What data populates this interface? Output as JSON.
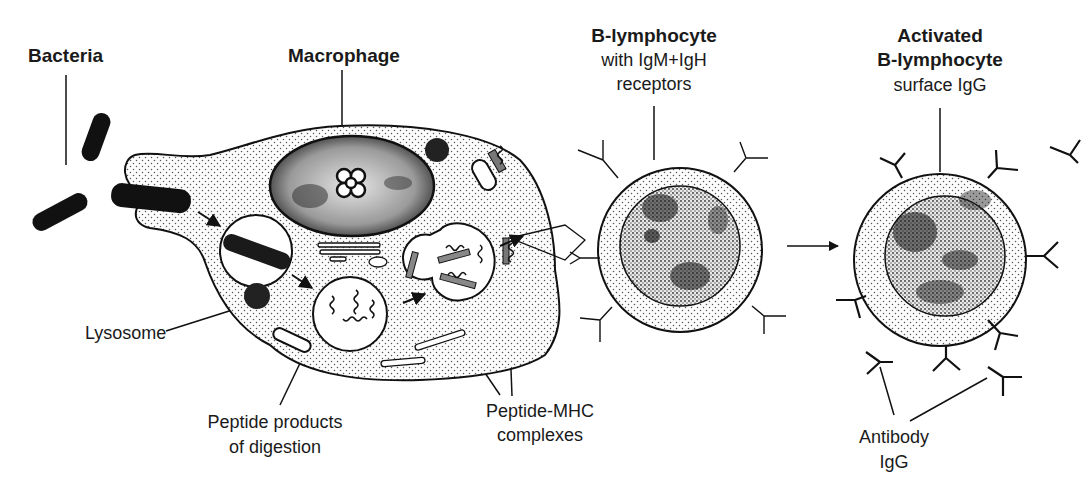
{
  "diagram": {
    "colors": {
      "ink": "#111111",
      "background": "#ffffff",
      "stipple": "#555555"
    },
    "labels": {
      "bacteria": "Bacteria",
      "macrophage": "Macrophage",
      "b_lymphocyte": {
        "title": "B-lymphocyte",
        "line1": "with IgM+IgH",
        "line2": "receptors"
      },
      "activated_b_lymphocyte": {
        "title1": "Activated",
        "title2": "B-lymphocyte",
        "line1": "surface IgG"
      },
      "lysosome": "Lysosome",
      "peptide_products": {
        "line1": "Peptide products",
        "line2": "of digestion"
      },
      "peptide_mhc": {
        "line1": "Peptide-MHC",
        "line2": "complexes"
      },
      "antibody": {
        "line1": "Antibody",
        "line2": "IgG"
      }
    },
    "flow": [
      "Bacteria",
      "Macrophage",
      "B-lymphocyte",
      "Activated B-lymphocyte"
    ]
  }
}
